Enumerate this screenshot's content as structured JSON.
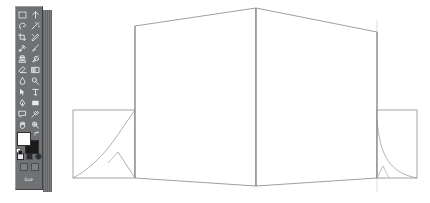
{
  "app": {
    "title": "Vector Drawing Application",
    "canvas_background": "#ffffff",
    "artwork_stroke_color": "#8a8a8a",
    "artwork_name": "tri-fold-display-panel-perspective-drawing"
  },
  "toolbox": {
    "name": "Toolbox",
    "background_color": "#6f7173",
    "tools": [
      {
        "id": "marquee",
        "label": "Rectangular Marquee Tool",
        "icon": "marquee-icon",
        "selected": false
      },
      {
        "id": "move",
        "label": "Move Tool",
        "icon": "move-icon",
        "selected": false
      },
      {
        "id": "lasso",
        "label": "Lasso Tool",
        "icon": "lasso-icon",
        "selected": false
      },
      {
        "id": "magic-wand",
        "label": "Magic Wand Tool",
        "icon": "magic-wand-icon",
        "selected": false
      },
      {
        "id": "crop",
        "label": "Crop Tool",
        "icon": "crop-icon",
        "selected": false
      },
      {
        "id": "slice",
        "label": "Slice Tool",
        "icon": "slice-icon",
        "selected": false
      },
      {
        "id": "healing",
        "label": "Healing Brush Tool",
        "icon": "healing-brush-icon",
        "selected": false
      },
      {
        "id": "brush",
        "label": "Brush Tool",
        "icon": "brush-icon",
        "selected": false
      },
      {
        "id": "stamp",
        "label": "Clone Stamp Tool",
        "icon": "stamp-icon",
        "selected": false
      },
      {
        "id": "history-brush",
        "label": "History Brush Tool",
        "icon": "history-brush-icon",
        "selected": false
      },
      {
        "id": "eraser",
        "label": "Eraser Tool",
        "icon": "eraser-icon",
        "selected": false
      },
      {
        "id": "gradient",
        "label": "Gradient Tool",
        "icon": "gradient-icon",
        "selected": false
      },
      {
        "id": "blur",
        "label": "Blur Tool",
        "icon": "blur-icon",
        "selected": false
      },
      {
        "id": "dodge",
        "label": "Dodge Tool",
        "icon": "dodge-icon",
        "selected": false
      },
      {
        "id": "path-select",
        "label": "Path Selection Tool",
        "icon": "path-select-icon",
        "selected": false
      },
      {
        "id": "type",
        "label": "Type Tool",
        "icon": "type-icon",
        "selected": false
      },
      {
        "id": "pen",
        "label": "Pen Tool",
        "icon": "pen-icon",
        "selected": false
      },
      {
        "id": "shape",
        "label": "Rectangle Shape Tool",
        "icon": "shape-icon",
        "selected": false
      },
      {
        "id": "notes",
        "label": "Notes Tool",
        "icon": "notes-icon",
        "selected": false
      },
      {
        "id": "eyedropper",
        "label": "Eyedropper Tool",
        "icon": "eyedropper-icon",
        "selected": false
      },
      {
        "id": "hand",
        "label": "Hand Tool",
        "icon": "hand-icon",
        "selected": false
      },
      {
        "id": "zoom",
        "label": "Zoom Tool",
        "icon": "zoom-icon",
        "selected": false
      }
    ],
    "colors": {
      "foreground_label": "Set foreground color",
      "foreground": "#ffffff",
      "background_label": "Set background color",
      "background": "#1a1a1a",
      "swap_label": "Switch foreground and background colors",
      "reset_label": "Default foreground and background colors"
    },
    "modes": [
      {
        "id": "standard-mask",
        "label": "Edit in Standard Mode",
        "active": true
      },
      {
        "id": "quick-mask",
        "label": "Edit in Quick Mask Mode",
        "active": false
      },
      {
        "id": "mask-extra",
        "label": "Mask Options",
        "active": false
      }
    ],
    "screen_modes": [
      {
        "id": "standard-screen",
        "label": "Standard Screen Mode"
      },
      {
        "id": "full-screen-menu",
        "label": "Full Screen Mode With Menu Bar"
      }
    ],
    "jump_to": {
      "id": "jump-to-imageready",
      "label": "Jump to ImageReady"
    },
    "caption": ""
  },
  "artwork": {
    "name": "tri-fold display panel",
    "stroke": "#8a8a8a",
    "stroke_light": "#b6b6b6",
    "guide_color": "#c9c9c9",
    "panels": [
      {
        "id": "left-wing",
        "label": "Left wing panel",
        "points": "73,110 135,110 135,178 73,178",
        "curve": "M135,110 C112,140 100,165 73,178",
        "connector": "M117,153 L135,178"
      },
      {
        "id": "center-left-face",
        "label": "Center left face",
        "points": "135,26 256,8 256,186 135,178"
      },
      {
        "id": "center-right-face",
        "label": "Center right face",
        "points": "256,8 377,32 377,178 256,186"
      },
      {
        "id": "right-wing",
        "label": "Right wing panel",
        "points": "377,110 417,110 417,178 377,178",
        "curve": "M377,122 C381,160 392,174 417,178",
        "connector": "M383,165 L377,178"
      }
    ],
    "guides": [
      {
        "id": "guide-top",
        "label": "Top alignment tick",
        "x": 377,
        "y1": 22,
        "y2": 36
      },
      {
        "id": "guide-bottom",
        "label": "Bottom alignment tick",
        "x": 377,
        "y1": 172,
        "y2": 190
      }
    ]
  }
}
